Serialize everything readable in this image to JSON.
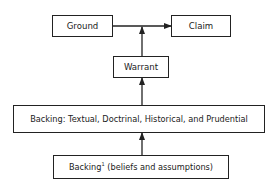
{
  "diagram": {
    "nodes": {
      "ground": {
        "label": "Ground"
      },
      "claim": {
        "label": "Claim"
      },
      "warrant": {
        "label": "Warrant"
      },
      "backing": {
        "label": "Backing: Textual, Doctrinal, Historical, and Prudential"
      },
      "backing1": {
        "label_main": "Backing",
        "label_sup": "1",
        "label_rest": " (beliefs and assumptions)"
      }
    },
    "edges": [
      {
        "from": "ground",
        "to": "claim"
      },
      {
        "from": "warrant",
        "to": "ground-claim-link"
      },
      {
        "from": "backing",
        "to": "warrant"
      },
      {
        "from": "backing1",
        "to": "backing"
      }
    ]
  }
}
